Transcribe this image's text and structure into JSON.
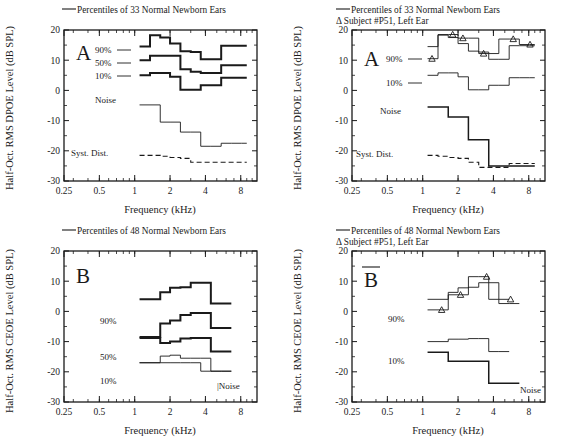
{
  "figure": {
    "axis": {
      "x_label": "Frequency (kHz)",
      "x_ticks": [
        "0.25",
        "0.5",
        "1",
        "2",
        "4",
        "8"
      ],
      "x_tick_values": [
        0.25,
        0.5,
        1,
        2,
        4,
        8
      ],
      "xlim": [
        0.25,
        11.0
      ],
      "xscale": "log",
      "y_ticks": [
        "20",
        "10",
        "0",
        "-10",
        "-20",
        "-30"
      ],
      "y_tick_values": [
        20,
        10,
        0,
        -10,
        -20,
        -30
      ],
      "ylim": [
        -30,
        20
      ],
      "y_label_dpoe": "Half-Oct. RMS DPOE Level (dB SPL)",
      "y_label_ceoe": "Half-Oct. RMS CEOE Level (dB SPL)"
    },
    "legend_marker_symbol": "Δ"
  },
  "chart_data": [
    {
      "id": "panel-A-left",
      "type": "line",
      "panel_letter": "A",
      "title": "",
      "xlabel": "Frequency (kHz)",
      "ylabel": "Half-Oct. RMS DPOE Level (dB SPL)",
      "xlim": [
        0.25,
        11.0
      ],
      "ylim": [
        -30,
        20
      ],
      "xscale": "log",
      "grid": false,
      "legend": [
        "Percentiles of 33 Normal Newborn Ears"
      ],
      "legend_position": "above-plot",
      "annotations": [
        "90%",
        "50%",
        "10%",
        "Noise",
        "Syst. Dist."
      ],
      "band_edges": [
        1.1,
        1.35,
        1.65,
        2.0,
        2.45,
        3.0,
        3.65,
        4.45,
        5.45,
        6.65,
        8.1,
        9.0
      ],
      "series": [
        {
          "name": "90%",
          "style": "thick",
          "values": [
            14.5,
            18.3,
            17.5,
            15.5,
            13.0,
            12.7,
            10.3,
            10.3,
            14.8,
            14.8,
            14.8
          ]
        },
        {
          "name": "50%",
          "style": "thick",
          "values": [
            10.0,
            11.5,
            11.5,
            11.5,
            7.0,
            6.2,
            5.8,
            5.8,
            8.3,
            8.3,
            8.3
          ]
        },
        {
          "name": "10%",
          "style": "thick",
          "values": [
            5.0,
            5.8,
            5.8,
            4.5,
            0.2,
            0.2,
            1.7,
            1.7,
            4.2,
            4.2,
            4.2
          ]
        },
        {
          "name": "Noise",
          "style": "thin",
          "values": [
            -4.8,
            -4.8,
            -10.5,
            -10.5,
            -13.8,
            -13.8,
            -18.5,
            -18.5,
            -17.5,
            -17.5,
            -17.5
          ]
        },
        {
          "name": "Syst. Dist.",
          "style": "dashed",
          "values": [
            -21.5,
            -21.5,
            -21.8,
            -22.2,
            -22.5,
            -23.8,
            -23.8,
            -23.8,
            -23.8,
            -23.8,
            -23.8
          ]
        }
      ]
    },
    {
      "id": "panel-A-right",
      "type": "line",
      "panel_letter": "A",
      "title": "",
      "xlabel": "Frequency (kHz)",
      "ylabel": "Half-Oct. RMS DPOE Level (dB SPL)",
      "xlim": [
        0.25,
        11.0
      ],
      "ylim": [
        -30,
        20
      ],
      "xscale": "log",
      "grid": false,
      "legend": [
        "Percentiles of 33 Normal Newborn Ears",
        "Δ Subject #P51, Left Ear"
      ],
      "legend_position": "above-plot",
      "annotations": [
        "90%",
        "10%",
        "Noise",
        "Syst. Dist."
      ],
      "band_edges": [
        1.1,
        1.35,
        1.65,
        2.0,
        2.45,
        3.0,
        3.65,
        4.45,
        5.45,
        6.65,
        8.1,
        9.0
      ],
      "series": [
        {
          "name": "90%",
          "style": "thin",
          "values": [
            14.5,
            18.3,
            17.5,
            15.5,
            13.0,
            12.7,
            10.3,
            10.3,
            14.8,
            14.8,
            14.8
          ]
        },
        {
          "name": "10%",
          "style": "thin",
          "values": [
            5.0,
            5.8,
            5.8,
            4.5,
            0.2,
            0.2,
            1.7,
            1.7,
            4.2,
            4.2,
            4.2
          ]
        },
        {
          "name": "Subject #P51 Left Ear",
          "style": "thick-marker",
          "marker": "triangle",
          "values": [
            10.5,
            18.5,
            18.5,
            17.3,
            17.3,
            12.2,
            12.2,
            17.0,
            17.0,
            15.2,
            15.2
          ],
          "marker_points": [
            {
              "x": 1.2,
              "y": 10.5
            },
            {
              "x": 1.8,
              "y": 18.5
            },
            {
              "x": 2.2,
              "y": 17.3
            },
            {
              "x": 3.3,
              "y": 12.2
            },
            {
              "x": 5.9,
              "y": 17.0
            },
            {
              "x": 8.2,
              "y": 15.2
            }
          ]
        },
        {
          "name": "Noise",
          "style": "med",
          "values": [
            -5.5,
            -5.5,
            -8.8,
            -8.8,
            -16.3,
            -16.3,
            -25.0,
            -25.0,
            -25.0,
            -25.0,
            -25.0
          ]
        },
        {
          "name": "Syst. Dist.",
          "style": "dashed",
          "values": [
            -21.5,
            -21.8,
            -22.2,
            -22.5,
            -23.8,
            -25.5,
            -25.5,
            -25.5,
            -24.2,
            -24.2,
            -24.2
          ]
        }
      ]
    },
    {
      "id": "panel-B-left",
      "type": "line",
      "panel_letter": "B",
      "title": "",
      "xlabel": "Frequency (kHz)",
      "ylabel": "Half-Oct. RMS CEOE Level (dB SPL)",
      "xlim": [
        0.25,
        11.0
      ],
      "ylim": [
        -30,
        20
      ],
      "xscale": "log",
      "grid": false,
      "legend": [
        "Percentiles of 48 Normal Newborn Ears"
      ],
      "legend_position": "above-plot",
      "annotations": [
        "90%",
        "50%",
        "10%",
        "Noise"
      ],
      "band_edges": [
        1.1,
        1.35,
        1.65,
        2.0,
        2.45,
        3.0,
        3.65,
        4.45,
        5.45,
        6.65
      ],
      "series": [
        {
          "name": "90%",
          "style": "thick",
          "values": [
            4.0,
            4.0,
            6.3,
            7.8,
            8.0,
            9.5,
            9.5,
            2.6,
            2.6
          ]
        },
        {
          "name": "mid-upper",
          "style": "thick",
          "values": [
            -8.5,
            -8.5,
            -4.0,
            -3.0,
            -1.2,
            -0.5,
            -0.5,
            -5.5,
            -5.5
          ]
        },
        {
          "name": "50%",
          "style": "thick",
          "values": [
            -8.8,
            -8.8,
            -10.5,
            -10.0,
            -9.0,
            -8.8,
            -8.8,
            -13.3,
            -13.3
          ]
        },
        {
          "name": "10%",
          "style": "thin",
          "values": [
            -17.0,
            -17.0,
            -14.8,
            -14.5,
            -15.5,
            -15.5,
            -15.5,
            -19.8,
            -19.8
          ]
        },
        {
          "name": "Noise",
          "style": "thin",
          "values": [
            -17.0,
            -17.0,
            -17.0,
            -17.0,
            -17.0,
            -17.0,
            -19.8,
            -19.8,
            -19.8
          ]
        }
      ]
    },
    {
      "id": "panel-B-right",
      "type": "line",
      "panel_letter": "B",
      "title": "",
      "xlabel": "Frequency (kHz)",
      "ylabel": "Half-Oct. RMS CEOE Level (dB SPL)",
      "xlim": [
        0.25,
        11.0
      ],
      "ylim": [
        -30,
        20
      ],
      "xscale": "log",
      "grid": false,
      "legend": [
        "Percentiles of 48 Normal Newborn Ears",
        "Δ Subject #P51, Left Ear"
      ],
      "legend_position": "above-plot",
      "annotations": [
        "90%",
        "10%",
        "Noise"
      ],
      "band_edges": [
        1.1,
        1.35,
        1.65,
        2.0,
        2.45,
        3.0,
        3.65,
        4.45,
        5.45,
        6.65
      ],
      "series": [
        {
          "name": "90%",
          "style": "thin",
          "values": [
            4.0,
            4.0,
            6.3,
            7.8,
            8.0,
            9.5,
            9.5,
            2.6,
            2.6
          ]
        },
        {
          "name": "Subject #P51 Left Ear",
          "style": "thick-marker",
          "marker": "triangle",
          "values": [
            0.5,
            0.5,
            5.5,
            5.5,
            11.5,
            11.5,
            4.0,
            4.0
          ],
          "marker_points": [
            {
              "x": 1.45,
              "y": 0.5
            },
            {
              "x": 2.1,
              "y": 5.5
            },
            {
              "x": 3.5,
              "y": 11.5
            },
            {
              "x": 5.6,
              "y": 4.0
            }
          ]
        },
        {
          "name": "10% / floor",
          "style": "thin",
          "values": [
            -10.0,
            -10.0,
            -9.2,
            -9.2,
            -9.0,
            -9.0,
            -13.3,
            -13.3
          ]
        },
        {
          "name": "Noise",
          "style": "med",
          "values": [
            -13.5,
            -13.5,
            -16.5,
            -16.5,
            -16.5,
            -16.5,
            -23.8,
            -23.8,
            -23.8
          ]
        }
      ]
    }
  ],
  "panels": {
    "top_left": {
      "panel_letter": "A",
      "legend_line1": "Percentiles of 33 Normal Newborn Ears",
      "legend_line2": "",
      "y_label": "Half-Oct. RMS DPOE Level (dB SPL)",
      "x_label": "Frequency (kHz)",
      "labels": {
        "p90": "90%",
        "p50": "50%",
        "p10": "10%",
        "noise": "Noise",
        "syst": "Syst. Dist."
      }
    },
    "top_right": {
      "panel_letter": "A",
      "legend_line1": "Percentiles of 33 Normal Newborn Ears",
      "legend_line2": "Δ Subject #P51, Left Ear",
      "y_label": "Half-Oct. RMS DPOE Level (dB SPL)",
      "x_label": "Frequency (kHz)",
      "labels": {
        "p90": "90%",
        "p10": "10%",
        "noise": "Noise",
        "syst": "Syst. Dist."
      }
    },
    "bottom_left": {
      "panel_letter": "B",
      "legend_line1": "Percentiles of 48 Normal Newborn Ears",
      "legend_line2": "",
      "y_label": "Half-Oct. RMS CEOE Level (dB SPL)",
      "x_label": "Frequency (kHz)",
      "labels": {
        "p90": "90%",
        "p50": "50%",
        "p10": "10%",
        "noise": "|Noise"
      }
    },
    "bottom_right": {
      "panel_letter": "B",
      "legend_line1": "Percentiles of 48 Normal Newborn Ears",
      "legend_line2": "Δ Subject #P51, Left Ear",
      "y_label": "Half-Oct. RMS CEOE Level (dB SPL)",
      "x_label": "Frequency (kHz)",
      "labels": {
        "p90": "90%",
        "p10": "10%",
        "noise": "Noise"
      }
    }
  }
}
